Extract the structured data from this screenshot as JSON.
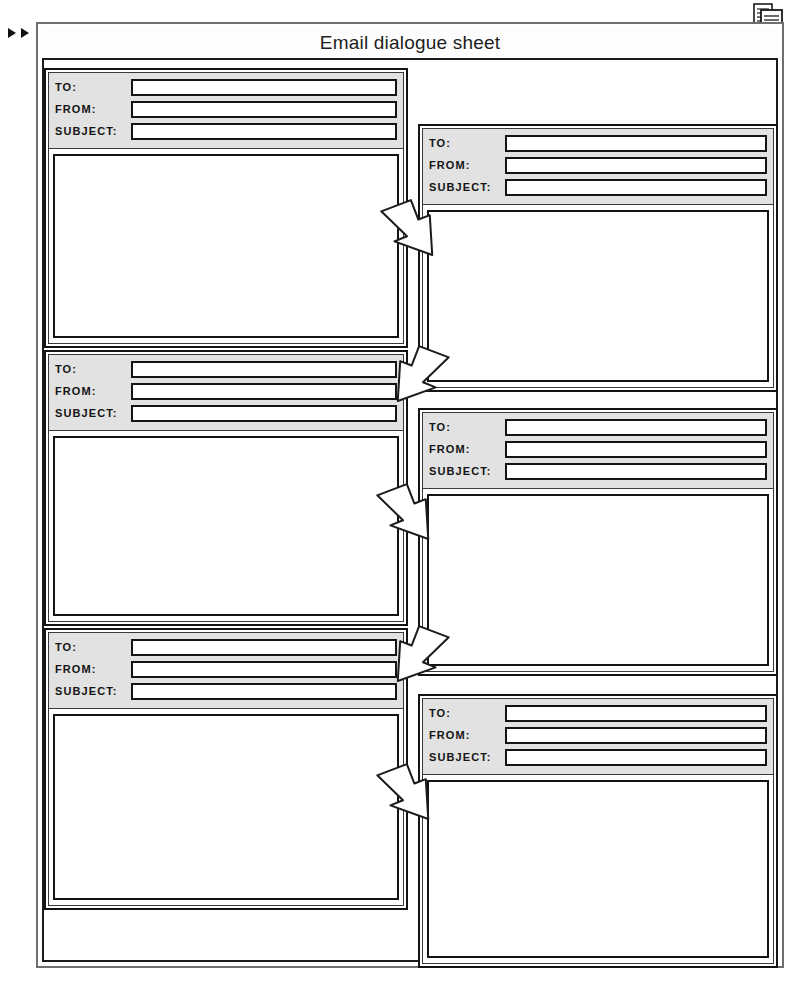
{
  "page": {
    "title": "Email dialogue sheet",
    "scan_artifact_text": "",
    "margin_markers": [
      "play-triangle",
      "play-triangle"
    ],
    "corner_icon": "document-stack-icon"
  },
  "field_labels": {
    "to": "TO:",
    "from": "FROM:",
    "subject": "SUBJECT:"
  },
  "colors": {
    "header_fill": "#e2e2e2",
    "stroke": "#141414",
    "frame_stroke": "#6f6f6f",
    "page_background": "#ffffff"
  },
  "cards": [
    {
      "id": "card-1",
      "column": "left",
      "to_value": "",
      "from_value": "",
      "subject_value": "",
      "body_value": "",
      "to_placeholder": "",
      "from_placeholder": "",
      "subject_placeholder": "",
      "body_placeholder": ""
    },
    {
      "id": "card-2",
      "column": "right",
      "to_value": "",
      "from_value": "",
      "subject_value": "",
      "body_value": "",
      "to_placeholder": "",
      "from_placeholder": "",
      "subject_placeholder": "",
      "body_placeholder": ""
    },
    {
      "id": "card-3",
      "column": "left",
      "to_value": "",
      "from_value": "",
      "subject_value": "",
      "body_value": "",
      "to_placeholder": "",
      "from_placeholder": "",
      "subject_placeholder": "",
      "body_placeholder": ""
    },
    {
      "id": "card-4",
      "column": "right",
      "to_value": "",
      "from_value": "",
      "subject_value": "",
      "body_value": "",
      "to_placeholder": "",
      "from_placeholder": "",
      "subject_placeholder": "",
      "body_placeholder": ""
    },
    {
      "id": "card-5",
      "column": "left",
      "to_value": "",
      "from_value": "",
      "subject_value": "",
      "body_value": "",
      "to_placeholder": "",
      "from_placeholder": "",
      "subject_placeholder": "",
      "body_placeholder": ""
    },
    {
      "id": "card-6",
      "column": "right",
      "to_value": "",
      "from_value": "",
      "subject_value": "",
      "body_value": "",
      "to_placeholder": "",
      "from_placeholder": "",
      "subject_placeholder": "",
      "body_placeholder": ""
    }
  ],
  "arrows": [
    {
      "id": "arrow-1",
      "direction": "down-right",
      "from_card": "card-1",
      "to_card": "card-2"
    },
    {
      "id": "arrow-2",
      "direction": "down-left",
      "from_card": "card-2",
      "to_card": "card-3"
    },
    {
      "id": "arrow-3",
      "direction": "down-right",
      "from_card": "card-3",
      "to_card": "card-4"
    },
    {
      "id": "arrow-4",
      "direction": "down-left",
      "from_card": "card-4",
      "to_card": "card-5"
    },
    {
      "id": "arrow-5",
      "direction": "down-right",
      "from_card": "card-5",
      "to_card": "card-6"
    }
  ]
}
